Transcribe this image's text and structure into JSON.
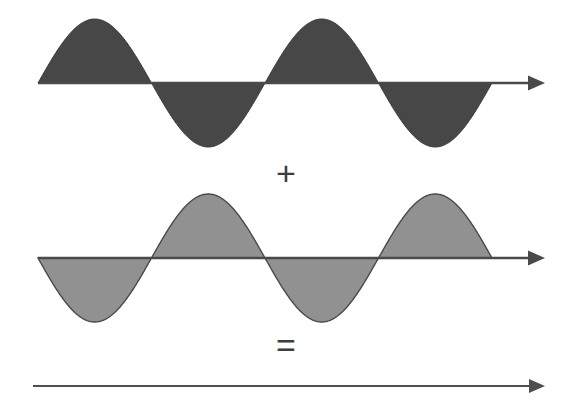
{
  "figure": {
    "background_color": "#ffffff",
    "width": 573,
    "height": 411
  },
  "operators": {
    "plus": "+",
    "equals": "="
  },
  "colors": {
    "wave_top_fill": "#474747",
    "wave_top_stroke": "#3a3a3a",
    "wave_middle_fill": "#919191",
    "wave_middle_stroke": "#4a4a4a",
    "axis_line": "#4a4a4a",
    "result_line": "#4f4f4f",
    "background": "#ffffff"
  },
  "chart_data": {
    "type": "line",
    "xlabel": "",
    "ylabel": "",
    "grid": false,
    "legend": false,
    "axis_arrow": true,
    "x": [
      0,
      0.5,
      1,
      1.5,
      2,
      2.5,
      3,
      3.5,
      4
    ],
    "xlim": [
      0,
      4
    ],
    "ylim": [
      -1,
      1
    ],
    "series": [
      {
        "name": "wave-1",
        "label": "Wave 1",
        "amplitude": 1,
        "phase_degrees": 0,
        "cycles": 2,
        "fill": "#474747",
        "values": [
          0,
          1,
          0,
          -1,
          0,
          1,
          0,
          -1,
          0
        ]
      },
      {
        "name": "wave-2",
        "label": "Wave 2",
        "amplitude": 1,
        "phase_degrees": 180,
        "cycles": 2,
        "fill": "#919191",
        "values": [
          0,
          -1,
          0,
          1,
          0,
          -1,
          0,
          1,
          0
        ]
      },
      {
        "name": "resultant",
        "label": "Resultant",
        "amplitude": 0,
        "phase_degrees": 0,
        "cycles": 0,
        "fill": "none",
        "values": [
          0,
          0,
          0,
          0,
          0,
          0,
          0,
          0,
          0
        ]
      }
    ]
  },
  "panels": {
    "wave_top": {
      "name": "First sine wave",
      "baseline_y": 83,
      "start_x": 38,
      "end_x": 492,
      "arrow_tip_x": 545,
      "amplitude_px": 64,
      "period_px": 227,
      "starts_upward": true
    },
    "wave_middle": {
      "name": "Second sine wave (inverted)",
      "baseline_y": 258,
      "start_x": 38,
      "end_x": 492,
      "arrow_tip_x": 545,
      "amplitude_px": 64,
      "period_px": 227,
      "starts_upward": false
    },
    "result_line": {
      "name": "Flat resultant line",
      "baseline_y": 386,
      "start_x": 33,
      "end_x": 530,
      "arrow_tip_x": 545,
      "amplitude_px": 0
    }
  }
}
